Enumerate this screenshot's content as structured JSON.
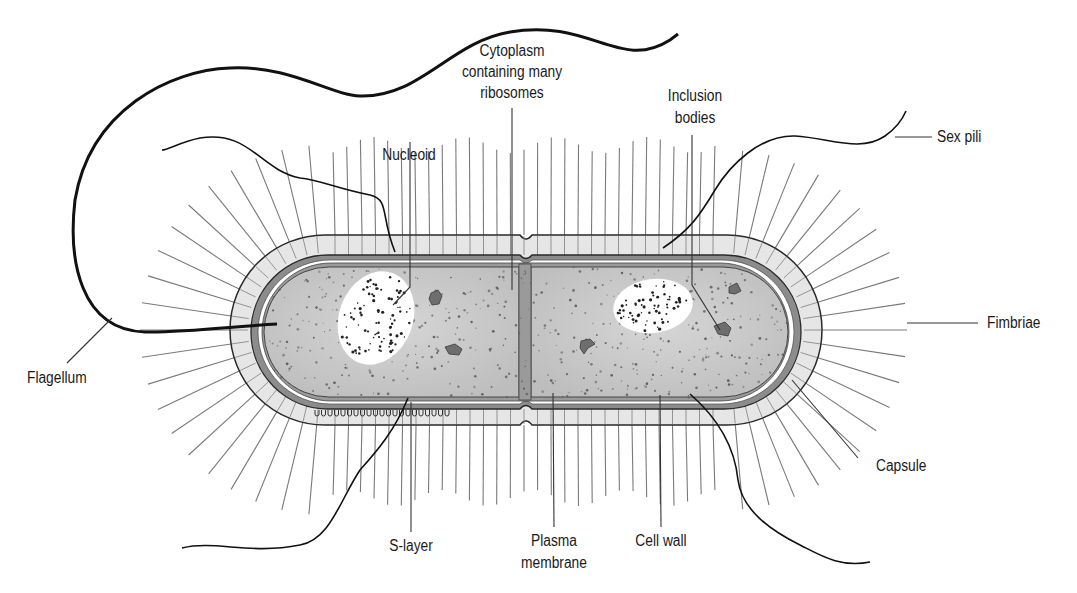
{
  "diagram": {
    "colors": {
      "background": "#ffffff",
      "capsule_fill": "#e6e6e6",
      "cell_wall_fill": "#8c8c8c",
      "membrane_gap": "#ffffff",
      "cytoplasm_fill": "#c9c9c9",
      "nucleoid_fill": "#ffffff",
      "inclusion_fill": "#6e6e6e",
      "stroke": "#1a1a1a",
      "fimbria_stroke": "#7a7a7a"
    },
    "labels": {
      "nucleoid": "Nucleoid",
      "cytoplasm": [
        "Cytoplasm",
        "containing many",
        "ribosomes"
      ],
      "inclusion_bodies": [
        "Inclusion",
        "bodies"
      ],
      "sex_pili": "Sex pili",
      "fimbriae": "Fimbriae",
      "flagellum": "Flagellum",
      "capsule": "Capsule",
      "s_layer": "S-layer",
      "plasma_membrane": [
        "Plasma",
        "membrane"
      ],
      "cell_wall": "Cell wall"
    }
  }
}
